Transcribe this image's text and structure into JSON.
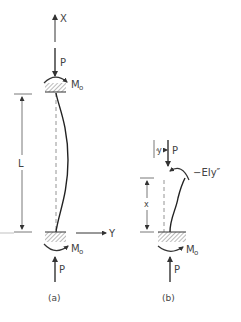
{
  "figure": {
    "panel_a": {
      "caption": "(a)",
      "axis_x_label": "X",
      "axis_y_label": "Y",
      "load_top_label": "P",
      "load_bottom_label": "P",
      "moment_top_label": "M",
      "moment_top_sub": "o",
      "moment_bottom_label": "M",
      "moment_bottom_sub": "o",
      "length_label": "L"
    },
    "panel_b": {
      "caption": "(b)",
      "load_top_label": "P",
      "load_bottom_label": "P",
      "deflection_label": "y",
      "height_label": "x",
      "internal_moment_label": "−EIy″",
      "moment_bottom_label": "M",
      "moment_bottom_sub": "o"
    },
    "colors": {
      "ink": "#333333",
      "dashed": "#888888",
      "background": "#ffffff"
    }
  }
}
